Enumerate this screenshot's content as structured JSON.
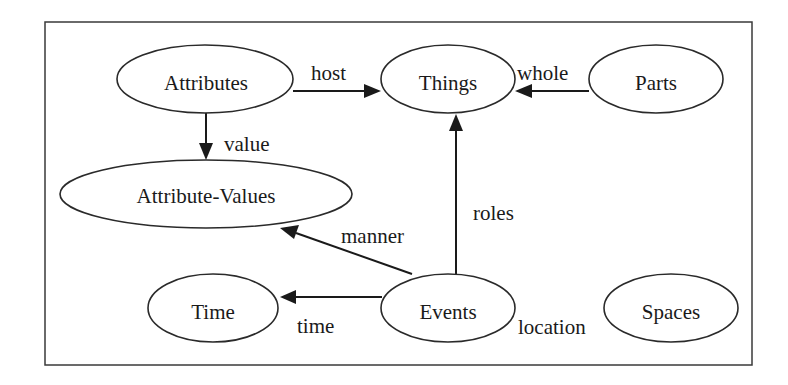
{
  "diagram": {
    "nodes": [
      {
        "id": "attributes",
        "label": "Attributes"
      },
      {
        "id": "things",
        "label": "Things"
      },
      {
        "id": "parts",
        "label": "Parts"
      },
      {
        "id": "attribute_values",
        "label": "Attribute-Values"
      },
      {
        "id": "time",
        "label": "Time"
      },
      {
        "id": "events",
        "label": "Events"
      },
      {
        "id": "spaces",
        "label": "Spaces"
      }
    ],
    "edges": [
      {
        "from": "Attributes",
        "to": "Things",
        "label": "host"
      },
      {
        "from": "Parts",
        "to": "Things",
        "label": "whole"
      },
      {
        "from": "Attributes",
        "to": "Attribute-Values",
        "label": "value"
      },
      {
        "from": "Events",
        "to": "Things",
        "label": "roles"
      },
      {
        "from": "Events",
        "to": "Attribute-Values",
        "label": "manner"
      },
      {
        "from": "Events",
        "to": "Time",
        "label": "time"
      },
      {
        "from": "Events",
        "to": "Spaces",
        "label": "location"
      }
    ]
  }
}
